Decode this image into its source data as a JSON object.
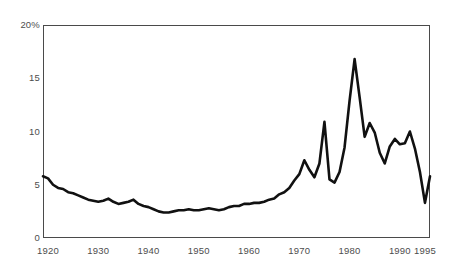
{
  "chart_data": {
    "type": "line",
    "title": "",
    "subtitle": "",
    "xlabel": "",
    "ylabel": "",
    "xlim": [
      1919,
      1996
    ],
    "ylim": [
      0,
      20
    ],
    "grid": false,
    "legend": null,
    "y_ticks": [
      {
        "value": 20,
        "label": "20%"
      },
      {
        "value": 15,
        "label": "15"
      },
      {
        "value": 10,
        "label": "10"
      },
      {
        "value": 5,
        "label": "5"
      },
      {
        "value": 0,
        "label": "0"
      }
    ],
    "x_ticks": [
      {
        "value": 1920,
        "label": "1920"
      },
      {
        "value": 1930,
        "label": "1930"
      },
      {
        "value": 1940,
        "label": "1940"
      },
      {
        "value": 1950,
        "label": "1950"
      },
      {
        "value": 1960,
        "label": "1960"
      },
      {
        "value": 1970,
        "label": "1970"
      },
      {
        "value": 1980,
        "label": "1980"
      },
      {
        "value": 1990,
        "label": "1990"
      },
      {
        "value": 1995,
        "label": "1995"
      }
    ],
    "series": [
      {
        "name": "rate",
        "color": "#111111",
        "line_width": 2.6,
        "x": [
          1919,
          1920,
          1921,
          1922,
          1923,
          1924,
          1925,
          1926,
          1927,
          1928,
          1929,
          1930,
          1931,
          1932,
          1933,
          1934,
          1935,
          1936,
          1937,
          1938,
          1939,
          1940,
          1941,
          1942,
          1943,
          1944,
          1945,
          1946,
          1947,
          1948,
          1949,
          1950,
          1951,
          1952,
          1953,
          1954,
          1955,
          1956,
          1957,
          1958,
          1959,
          1960,
          1961,
          1962,
          1963,
          1964,
          1965,
          1966,
          1967,
          1968,
          1969,
          1970,
          1971,
          1972,
          1973,
          1974,
          1975,
          1976,
          1977,
          1978,
          1979,
          1980,
          1981,
          1982,
          1983,
          1984,
          1985,
          1986,
          1987,
          1988,
          1989,
          1990,
          1991,
          1992,
          1993,
          1994,
          1995,
          1996
        ],
        "y": [
          5.8,
          5.6,
          5.0,
          4.7,
          4.6,
          4.3,
          4.2,
          4.0,
          3.8,
          3.6,
          3.5,
          3.4,
          3.5,
          3.7,
          3.4,
          3.2,
          3.3,
          3.4,
          3.6,
          3.2,
          3.0,
          2.9,
          2.7,
          2.5,
          2.4,
          2.4,
          2.5,
          2.6,
          2.6,
          2.7,
          2.6,
          2.6,
          2.7,
          2.8,
          2.7,
          2.6,
          2.7,
          2.9,
          3.0,
          3.0,
          3.2,
          3.2,
          3.3,
          3.3,
          3.4,
          3.6,
          3.7,
          4.1,
          4.3,
          4.7,
          5.4,
          6.0,
          7.3,
          6.4,
          5.7,
          7.0,
          10.9,
          5.5,
          5.2,
          6.2,
          8.5,
          12.9,
          16.8,
          13.2,
          9.5,
          10.8,
          9.9,
          8.0,
          7.0,
          8.6,
          9.3,
          8.8,
          8.9,
          10.0,
          8.4,
          6.2,
          3.3,
          5.8
        ]
      }
    ]
  }
}
